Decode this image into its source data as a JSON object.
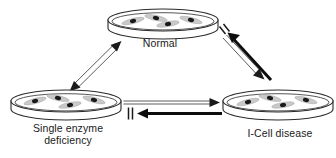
{
  "figure": {
    "type": "diagram",
    "background_color": "#ffffff",
    "ink_color": "#1a1a1a",
    "dish_fill_color": "#ffffff",
    "cell_body_color": "#c8c8c8",
    "nucleus_color": "#1a1a1a"
  },
  "nodes": [
    {
      "id": "normal",
      "label": "Normal",
      "icon": "petri-dish-icon",
      "position": "top-center"
    },
    {
      "id": "single-enzyme-deficiency",
      "label_line1": "Single enzyme",
      "label_line2": "deficiency",
      "icon": "petri-dish-icon",
      "position": "bottom-left"
    },
    {
      "id": "icell-disease",
      "label": "I-Cell disease",
      "icon": "petri-dish-icon",
      "position": "bottom-right"
    }
  ],
  "connectors": [
    {
      "id": "normal-single-enzyme",
      "style": "open-outline",
      "heads": "double",
      "from": "normal",
      "to": "single-enzyme-deficiency",
      "blocked": false,
      "block_marker": ""
    },
    {
      "id": "normal-to-icell",
      "style": "open-outline",
      "heads": "single",
      "from": "normal",
      "to": "icell-disease",
      "blocked": false,
      "block_marker": ""
    },
    {
      "id": "icell-to-normal",
      "style": "solid-thick",
      "heads": "single",
      "from": "icell-disease",
      "to": "normal",
      "blocked": true,
      "block_marker": "||"
    },
    {
      "id": "single-enzyme-to-icell",
      "style": "open-outline",
      "heads": "single",
      "from": "single-enzyme-deficiency",
      "to": "icell-disease",
      "blocked": false,
      "block_marker": ""
    },
    {
      "id": "icell-to-single-enzyme",
      "style": "solid-thick",
      "heads": "single",
      "from": "icell-disease",
      "to": "single-enzyme-deficiency",
      "blocked": true,
      "block_marker": "||"
    }
  ]
}
